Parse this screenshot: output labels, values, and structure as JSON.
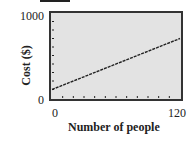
{
  "chart_data": {
    "type": "line",
    "title": "",
    "xlabel": "Number of people",
    "ylabel": "Cost ($)",
    "x": [
      0,
      120
    ],
    "series": [
      {
        "name": "Cost",
        "values": [
          100,
          700
        ]
      }
    ],
    "xlim": [
      0,
      120
    ],
    "ylim": [
      0,
      1000
    ],
    "x_tick_labels": [
      "0",
      "120"
    ],
    "y_tick_labels": [
      "0",
      "1000"
    ],
    "grid": false,
    "background": "#e3e3e3",
    "line_color": "#222222",
    "x_minor_ticks": 12,
    "y_minor_ticks": 10
  }
}
